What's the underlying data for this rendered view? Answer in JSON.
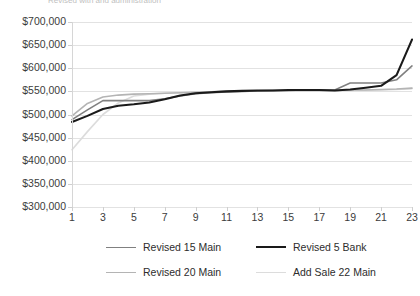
{
  "title_fragment": "Revised with and administration",
  "chart_data": {
    "type": "line",
    "title": "Revised with and administration",
    "xlabel": "",
    "ylabel": "",
    "ylim": [
      300000,
      700000
    ],
    "ytick_step": 50000,
    "ytick_labels": [
      "$700,000",
      "$650,000",
      "$600,000",
      "$550,000",
      "$500,000",
      "$450,000",
      "$400,000",
      "$350,000",
      "$300,000"
    ],
    "ytick_values": [
      700000,
      650000,
      600000,
      550000,
      500000,
      450000,
      400000,
      350000,
      300000
    ],
    "x": [
      1,
      2,
      3,
      4,
      5,
      6,
      7,
      8,
      9,
      10,
      11,
      12,
      13,
      14,
      15,
      16,
      17,
      18,
      19,
      20,
      21,
      22,
      23
    ],
    "xtick_labels": [
      "1",
      "3",
      "5",
      "7",
      "9",
      "11",
      "13",
      "15",
      "17",
      "19",
      "21",
      "23"
    ],
    "xtick_values": [
      1,
      3,
      5,
      7,
      9,
      11,
      13,
      15,
      17,
      19,
      21,
      23
    ],
    "grid": true,
    "legend_position": "bottom",
    "series": [
      {
        "name": "Revised 15 Main",
        "color": "#808080",
        "width": 1.6,
        "values": [
          489000,
          510000,
          530000,
          530000,
          530000,
          530000,
          534000,
          540000,
          545000,
          547000,
          549000,
          550000,
          551000,
          552000,
          552000,
          553000,
          553000,
          553000,
          568000,
          568000,
          568000,
          575000,
          605000
        ]
      },
      {
        "name": "Revised 5 Bank",
        "color": "#1a1a1a",
        "width": 2.1,
        "values": [
          484000,
          497000,
          512000,
          519000,
          522000,
          526000,
          533000,
          541000,
          546000,
          548000,
          550000,
          551000,
          552000,
          552000,
          553000,
          553000,
          553000,
          552000,
          554000,
          558000,
          562000,
          585000,
          662000
        ]
      },
      {
        "name": "Revised 20 Main",
        "color": "#b4b4b4",
        "width": 1.6,
        "values": [
          497000,
          524000,
          538000,
          542000,
          544000,
          545000,
          546000,
          547000,
          548000,
          549000,
          550000,
          551000,
          551000,
          552000,
          552000,
          552000,
          552000,
          552000,
          553000,
          553000,
          554000,
          555000,
          557000
        ]
      },
      {
        "name": "Add Sale 22 Main",
        "color": "#dcdcdc",
        "width": 1.6,
        "values": [
          424000,
          463000,
          500000,
          525000,
          540000,
          544000,
          546000,
          547000,
          548000,
          549000,
          550000,
          550000,
          551000,
          551000,
          552000,
          552000,
          552000,
          552000,
          553000,
          553000,
          553000,
          554000,
          556000
        ]
      }
    ]
  },
  "legend": {
    "items": [
      {
        "label": "Revised 15 Main",
        "color": "#808080",
        "width": 1.6
      },
      {
        "label": "Revised 5 Bank",
        "color": "#1a1a1a",
        "width": 2.1
      },
      {
        "label": "Revised 20 Main",
        "color": "#b4b4b4",
        "width": 1.6
      },
      {
        "label": "Add Sale 22 Main",
        "color": "#dcdcdc",
        "width": 1.6
      }
    ]
  }
}
